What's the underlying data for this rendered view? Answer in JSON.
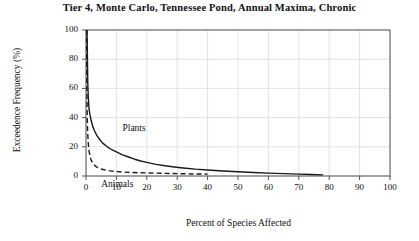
{
  "chart_data": {
    "type": "line",
    "title": "Tier 4, Monte Carlo, Tennessee Pond, Annual Maxima, Chronic",
    "xlabel": "Percent of Species Affected",
    "ylabel": "Exceedence Frequency (%)",
    "xlim": [
      0,
      100
    ],
    "ylim": [
      0,
      100
    ],
    "xticks": [
      0,
      10,
      20,
      30,
      40,
      50,
      60,
      70,
      80,
      90,
      100
    ],
    "yticks": [
      0,
      20,
      40,
      60,
      80,
      100
    ],
    "xtick_labels": [
      "0",
      "10",
      "20",
      "30",
      "40",
      "50",
      "60",
      "70",
      "80",
      "90",
      "100"
    ],
    "ytick_labels": [
      "0",
      "20",
      "40",
      "60",
      "80",
      "100"
    ],
    "grid": true,
    "legend": "inline-annotations",
    "series": [
      {
        "name": "Plants",
        "style": "solid",
        "color": "#1a1a1a",
        "label_x": 12,
        "label_y": 32,
        "points": [
          [
            0.35,
            100
          ],
          [
            0.4,
            92
          ],
          [
            0.45,
            84
          ],
          [
            0.5,
            76
          ],
          [
            0.55,
            69
          ],
          [
            0.6,
            63
          ],
          [
            0.7,
            57
          ],
          [
            0.8,
            52
          ],
          [
            0.9,
            49
          ],
          [
            1.0,
            46
          ],
          [
            1.3,
            42
          ],
          [
            1.7,
            38
          ],
          [
            2.2,
            34
          ],
          [
            2.8,
            31
          ],
          [
            3.5,
            28
          ],
          [
            4.5,
            25
          ],
          [
            5.5,
            22.5
          ],
          [
            7.0,
            20
          ],
          [
            8.5,
            18
          ],
          [
            10.0,
            16.5
          ],
          [
            12.0,
            14.5
          ],
          [
            14.0,
            13
          ],
          [
            16.0,
            11.5
          ],
          [
            18.0,
            10.3
          ],
          [
            20.0,
            9.3
          ],
          [
            23.0,
            8.0
          ],
          [
            26.0,
            7.0
          ],
          [
            29.0,
            6.2
          ],
          [
            32.0,
            5.5
          ],
          [
            36.0,
            4.7
          ],
          [
            40.0,
            4.1
          ],
          [
            45.0,
            3.4
          ],
          [
            50.0,
            2.9
          ],
          [
            55.0,
            2.4
          ],
          [
            60.0,
            2.0
          ],
          [
            65.0,
            1.6
          ],
          [
            70.0,
            1.3
          ],
          [
            74.0,
            1.0
          ],
          [
            78.0,
            0.8
          ]
        ]
      },
      {
        "name": "Animals",
        "style": "dashed",
        "color": "#1a1a1a",
        "label_x": 5,
        "label_y": -6,
        "points": [
          [
            0.2,
            100
          ],
          [
            0.22,
            88
          ],
          [
            0.25,
            76
          ],
          [
            0.28,
            64
          ],
          [
            0.32,
            54
          ],
          [
            0.36,
            46
          ],
          [
            0.42,
            39
          ],
          [
            0.5,
            33
          ],
          [
            0.6,
            28
          ],
          [
            0.7,
            24
          ],
          [
            0.85,
            20
          ],
          [
            1.0,
            17
          ],
          [
            1.3,
            14
          ],
          [
            1.6,
            11.5
          ],
          [
            2.0,
            9.5
          ],
          [
            2.5,
            8.0
          ],
          [
            3.2,
            6.6
          ],
          [
            4.0,
            5.6
          ],
          [
            5.0,
            4.8
          ],
          [
            6.5,
            4.0
          ],
          [
            8.0,
            3.5
          ],
          [
            10.0,
            3.0
          ],
          [
            12.0,
            2.7
          ],
          [
            15.0,
            2.4
          ],
          [
            18.0,
            2.2
          ],
          [
            22.0,
            2.0
          ],
          [
            26.0,
            1.8
          ],
          [
            30.0,
            1.6
          ],
          [
            33.0,
            1.5
          ],
          [
            36.0,
            1.4
          ],
          [
            40.0,
            1.3
          ]
        ]
      }
    ]
  },
  "axes": {
    "frame_color": "#555555",
    "grid_color": "#e2e2e2",
    "background": "#ffffff"
  }
}
